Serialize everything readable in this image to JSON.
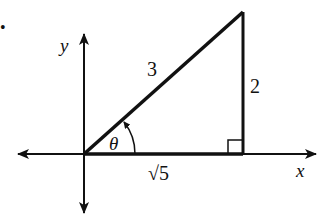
{
  "diagram": {
    "type": "right-triangle-on-axes",
    "bullet": "•",
    "axes": {
      "x_label": "x",
      "y_label": "y"
    },
    "triangle": {
      "hypotenuse_label": "3",
      "opposite_label": "2",
      "adjacent_label": "√5",
      "angle_label": "θ",
      "right_angle_marker": true
    },
    "colors": {
      "stroke": "#111111",
      "background": "#ffffff"
    }
  }
}
